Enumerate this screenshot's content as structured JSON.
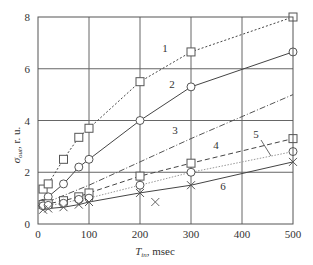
{
  "chart_data": {
    "type": "line",
    "title": "",
    "xlabel": "T_in, msec",
    "xlabel_main": "T",
    "xlabel_sub": "in",
    "xlabel_rest": ", msec",
    "ylabel": "σ_out, r. u.",
    "ylabel_main": "σ",
    "ylabel_sub": "out",
    "ylabel_rest": ", r. u.",
    "xlim": [
      0,
      500
    ],
    "ylim": [
      0,
      8
    ],
    "xticks": [
      0,
      100,
      200,
      300,
      400,
      500
    ],
    "yticks": [
      0,
      2,
      4,
      6,
      8
    ],
    "grid": true,
    "legend": "inline numeric labels",
    "series": [
      {
        "name": "1",
        "marker": "square",
        "line": "dotted",
        "color": "#444444",
        "x": [
          10,
          20,
          50,
          80,
          100,
          200,
          300,
          500
        ],
        "y": [
          1.35,
          1.55,
          2.5,
          3.35,
          3.7,
          5.5,
          6.65,
          8.0
        ],
        "label_pos": [
          165,
          52
        ]
      },
      {
        "name": "2",
        "marker": "circle",
        "line": "solid",
        "color": "#444444",
        "x": [
          10,
          20,
          50,
          80,
          100,
          200,
          300,
          500
        ],
        "y": [
          0.8,
          1.05,
          1.55,
          2.2,
          2.5,
          4.0,
          5.3,
          6.65
        ],
        "label_pos": [
          172,
          88
        ]
      },
      {
        "name": "3",
        "marker": "none",
        "line": "dashdot",
        "color": "#555555",
        "x": [
          0,
          100,
          200,
          300,
          400,
          500
        ],
        "y": [
          0.7,
          1.5,
          2.4,
          3.3,
          4.15,
          5.0
        ],
        "label_pos": [
          175,
          134
        ]
      },
      {
        "name": "4",
        "marker": "square",
        "line": "dashed",
        "color": "#444444",
        "x": [
          10,
          20,
          50,
          80,
          100,
          200,
          300,
          500
        ],
        "y": [
          0.75,
          0.78,
          0.9,
          1.05,
          1.2,
          1.85,
          2.35,
          3.3
        ],
        "label_pos": [
          216,
          149
        ]
      },
      {
        "name": "5",
        "marker": "circle",
        "line": "dotted-light",
        "color": "#999999",
        "x": [
          10,
          20,
          50,
          80,
          100,
          200,
          300,
          500
        ],
        "y": [
          0.7,
          0.72,
          0.8,
          0.95,
          1.0,
          1.5,
          2.0,
          2.8
        ],
        "label_pos": [
          256,
          138
        ]
      },
      {
        "name": "6",
        "marker": "x",
        "line": "solid",
        "color": "#444444",
        "x": [
          10,
          20,
          50,
          80,
          100,
          200,
          300,
          500
        ],
        "y": [
          0.55,
          0.6,
          0.65,
          0.75,
          0.85,
          1.2,
          1.5,
          2.4
        ],
        "label_pos": [
          223,
          190
        ]
      }
    ],
    "outliers": [
      {
        "series": "6",
        "marker": "x",
        "x": 230,
        "y": 0.85
      }
    ],
    "annotations": [
      {
        "text": "5",
        "leader_from": [
          261,
          140
        ],
        "leader_to": [
          271,
          156
        ]
      }
    ]
  }
}
